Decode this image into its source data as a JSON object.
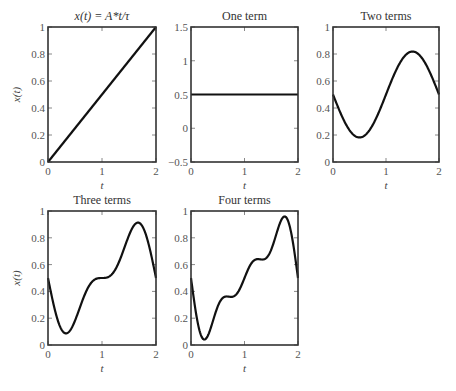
{
  "figure": {
    "background": "#ffffff",
    "line_color": "#111111",
    "frame_color": "#333333"
  },
  "chart_data": [
    {
      "type": "line",
      "title": "x(t) = A*t/τ",
      "xlabel": "t",
      "ylabel": "x(t)",
      "xlim": [
        0,
        2
      ],
      "ylim": [
        0,
        1
      ],
      "xticks": [
        "0",
        "1",
        "2"
      ],
      "yticks": [
        "0",
        "0.2",
        "0.4",
        "0.6",
        "0.8",
        "1"
      ],
      "ytick_values": [
        0,
        0.2,
        0.4,
        0.6,
        0.8,
        1
      ],
      "series": [
        {
          "name": "x(t)",
          "kind": "ramp",
          "x": [
            0,
            2
          ],
          "y": [
            0,
            1
          ]
        }
      ],
      "box": {
        "x": 48,
        "y": 27,
        "w": 108,
        "h": 135
      }
    },
    {
      "type": "line",
      "title": "One term",
      "xlabel": "t",
      "ylabel": "",
      "xlim": [
        0,
        2
      ],
      "ylim": [
        -0.5,
        1.5
      ],
      "xticks": [
        "0",
        "1",
        "2"
      ],
      "yticks": [
        "−0.5",
        "0",
        "0.5",
        "1",
        "1.5"
      ],
      "ytick_values": [
        -0.5,
        0,
        0.5,
        1,
        1.5
      ],
      "series": [
        {
          "name": "One term",
          "kind": "fourier",
          "terms": 1,
          "x": [
            0,
            2
          ],
          "y": [
            0.5,
            0.5
          ]
        }
      ],
      "box": {
        "x": 191,
        "y": 27,
        "w": 107,
        "h": 135
      }
    },
    {
      "type": "line",
      "title": "Two terms",
      "xlabel": "t",
      "ylabel": "",
      "xlim": [
        0,
        2
      ],
      "ylim": [
        0,
        1
      ],
      "xticks": [
        "0",
        "1",
        "2"
      ],
      "yticks": [
        "0",
        "0.2",
        "0.4",
        "0.6",
        "0.8",
        "1"
      ],
      "ytick_values": [
        0,
        0.2,
        0.4,
        0.6,
        0.8,
        1
      ],
      "series": [
        {
          "name": "Two terms",
          "kind": "fourier",
          "terms": 2,
          "x": [
            0,
            0.5,
            1,
            1.5,
            2
          ],
          "y": [
            0.5,
            0.18,
            0.5,
            0.82,
            0.5
          ]
        }
      ],
      "box": {
        "x": 333,
        "y": 27,
        "w": 106,
        "h": 135
      }
    },
    {
      "type": "line",
      "title": "Three terms",
      "xlabel": "t",
      "ylabel": "x(t)",
      "xlim": [
        0,
        2
      ],
      "ylim": [
        0,
        1
      ],
      "xticks": [
        "0",
        "1",
        "2"
      ],
      "yticks": [
        "0",
        "0.2",
        "0.4",
        "0.6",
        "0.8",
        "1"
      ],
      "ytick_values": [
        0,
        0.2,
        0.4,
        0.6,
        0.8,
        1
      ],
      "series": [
        {
          "name": "Three terms",
          "kind": "fourier",
          "terms": 3,
          "x": [
            0,
            0.33,
            1,
            1.67,
            2
          ],
          "y": [
            0.5,
            0.08,
            0.5,
            0.92,
            0.5
          ]
        }
      ],
      "box": {
        "x": 48,
        "y": 211,
        "w": 108,
        "h": 134
      }
    },
    {
      "type": "line",
      "title": "Four terms",
      "xlabel": "t",
      "ylabel": "",
      "xlim": [
        0,
        2
      ],
      "ylim": [
        0,
        1
      ],
      "xticks": [
        "0",
        "1",
        "2"
      ],
      "yticks": [
        "0",
        "0.2",
        "0.4",
        "0.6",
        "0.8",
        "1"
      ],
      "ytick_values": [
        0,
        0.2,
        0.4,
        0.6,
        0.8,
        1
      ],
      "series": [
        {
          "name": "Four terms",
          "kind": "fourier",
          "terms": 4,
          "x": [
            0,
            0.22,
            0.67,
            1.33,
            1.78,
            2
          ],
          "y": [
            0.5,
            0.04,
            0.36,
            0.64,
            0.96,
            0.5
          ]
        }
      ],
      "box": {
        "x": 191,
        "y": 211,
        "w": 107,
        "h": 134
      }
    }
  ]
}
